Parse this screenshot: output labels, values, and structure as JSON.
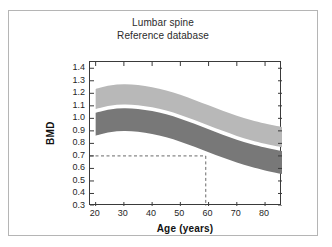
{
  "figure": {
    "title_line1": "Lumbar spine",
    "title_line2": "Reference database",
    "frame_color": "#b5b5b5",
    "background": "#ffffff"
  },
  "chart_data": {
    "type": "area",
    "title": "Lumbar spine Reference database",
    "xlabel": "Age (years)",
    "ylabel": "BMD",
    "xlim": [
      18,
      86
    ],
    "ylim": [
      0.3,
      1.45
    ],
    "grid": false,
    "legend": "none",
    "x_ticks": [
      20,
      30,
      40,
      50,
      60,
      70,
      80
    ],
    "y_ticks": [
      0.3,
      0.4,
      0.5,
      0.6,
      0.7,
      0.8,
      0.9,
      1.0,
      1.1,
      1.2,
      1.3,
      1.4
    ],
    "x": [
      20,
      25,
      30,
      35,
      40,
      45,
      50,
      55,
      60,
      65,
      70,
      75,
      80,
      86
    ],
    "series": [
      {
        "name": "upper band (light gray) upper bound",
        "color": "#b8b8b8",
        "values": [
          1.235,
          1.262,
          1.272,
          1.266,
          1.249,
          1.223,
          1.188,
          1.147,
          1.104,
          1.061,
          1.021,
          0.987,
          0.958,
          0.93
        ]
      },
      {
        "name": "upper band (light gray) lower bound",
        "color": "#b8b8b8",
        "values": [
          1.075,
          1.101,
          1.111,
          1.105,
          1.088,
          1.062,
          1.027,
          0.986,
          0.943,
          0.9,
          0.86,
          0.826,
          0.797,
          0.769
        ]
      },
      {
        "name": "lower band (dark gray) upper bound",
        "color": "#787878",
        "values": [
          1.045,
          1.071,
          1.081,
          1.075,
          1.058,
          1.032,
          0.997,
          0.956,
          0.913,
          0.87,
          0.83,
          0.796,
          0.767,
          0.739
        ]
      },
      {
        "name": "lower band (dark gray) lower bound",
        "color": "#787878",
        "values": [
          0.862,
          0.888,
          0.898,
          0.892,
          0.875,
          0.849,
          0.814,
          0.773,
          0.73,
          0.687,
          0.647,
          0.613,
          0.584,
          0.556
        ]
      }
    ],
    "annotations": [
      {
        "name": "threshold-guide",
        "style": "dashed",
        "color": "#6a6a6a",
        "bmd_value": 0.7,
        "age_value": 59,
        "description": "Dashed horizontal line at BMD 0.7 from the y-axis to age 59, then vertical down to the x-axis"
      }
    ]
  }
}
